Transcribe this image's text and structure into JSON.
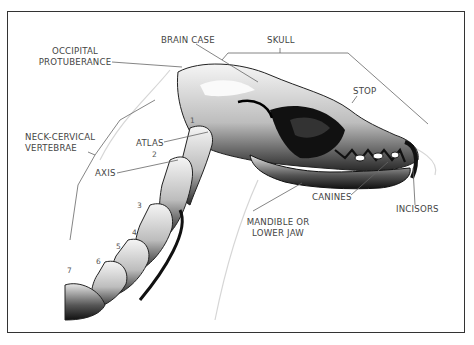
{
  "figure": {
    "labels": {
      "brain_case": "BRAIN CASE",
      "skull": "SKULL",
      "occipital_line1": "OCCIPITAL",
      "occipital_line2": "PROTUBERANCE",
      "stop": "STOP",
      "neck_line1": "NECK-CERVICAL",
      "neck_line2": "VERTEBRAE",
      "atlas": "ATLAS",
      "axis": "AXIS",
      "canines": "CANINES",
      "incisors": "INCISORS",
      "mandible_line1": "MANDIBLE OR",
      "mandible_line2": "LOWER JAW"
    },
    "vertebra_numbers": [
      "1",
      "2",
      "3",
      "4",
      "5",
      "6",
      "7"
    ],
    "colors": {
      "border": "#333333",
      "label_text": "#444444",
      "leader_line": "#666666",
      "bone_dark": "#111111",
      "bone_light": "#f2f2f2"
    }
  }
}
